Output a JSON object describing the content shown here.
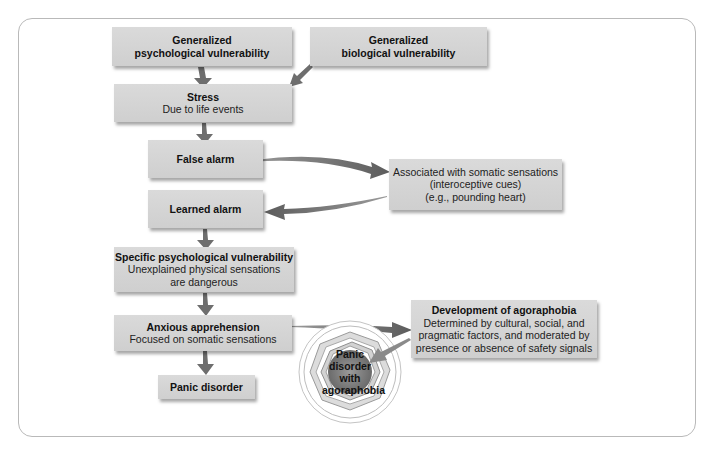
{
  "diagram": {
    "colors": {
      "box_fill": "#d4d4d4",
      "arrow": "#6e6e6e",
      "frame": "#b9b9b9",
      "core": "#8a8a8a"
    },
    "boxes": {
      "psych_vuln": {
        "title": "Generalized",
        "title2": "psychological vulnerability"
      },
      "bio_vuln": {
        "title": "Generalized",
        "title2": "biological vulnerability"
      },
      "stress": {
        "title": "Stress",
        "subtitle": "Due to life events"
      },
      "false_alarm": {
        "title": "False alarm"
      },
      "learned_alarm": {
        "title": "Learned alarm"
      },
      "associated": {
        "line1": "Associated with somatic sensations",
        "line2": "(interoceptive cues)",
        "line3": "(e.g., pounding heart)"
      },
      "specific_vuln": {
        "title": "Specific psychological vulnerability",
        "line1": "Unexplained physical sensations",
        "line2": "are dangerous"
      },
      "anxious": {
        "title": "Anxious apprehension",
        "subtitle": "Focused on somatic sensations"
      },
      "panic": {
        "title": "Panic disorder"
      },
      "agoraphobia": {
        "title": "Development of agoraphobia",
        "line1": "Determined by cultural, social, and",
        "line2": "pragmatic factors, and moderated by",
        "line3": "presence or absence of safety signals"
      }
    },
    "target": {
      "line1": "Panic",
      "line2": "disorder",
      "line3": "with",
      "line4": "agoraphobia"
    }
  }
}
